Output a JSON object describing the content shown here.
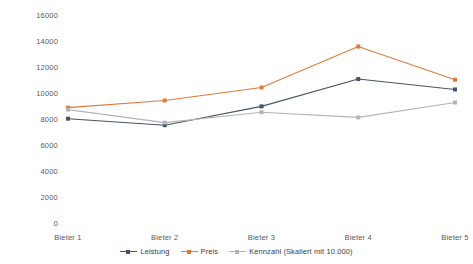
{
  "chart_data": {
    "type": "line",
    "title": "",
    "subtitle": "",
    "xlabel": "",
    "ylabel": "",
    "categories": [
      "Bieter 1",
      "Bieter 2",
      "Bieter 3",
      "Bieter 4",
      "Bieter 5"
    ],
    "series": [
      {
        "name": "Leistung",
        "color": "#44546A",
        "values": [
          8100,
          7600,
          9050,
          11150,
          10350
        ]
      },
      {
        "name": "Preis",
        "color": "#E07B39",
        "values": [
          8950,
          9500,
          10500,
          13650,
          11100
        ]
      },
      {
        "name": "Kennzahl (Skaliert mit 10.000)",
        "color": "#B4B4B4",
        "values": [
          8800,
          7800,
          8600,
          8200,
          9350
        ]
      }
    ],
    "ylim": [
      0,
      16000
    ],
    "ytick_step": 2000,
    "yticks": [
      "16000",
      "14000",
      "12000",
      "10000",
      "8000",
      "6000",
      "4000",
      "2000",
      "0"
    ],
    "grid": false,
    "legend_position": "bottom",
    "legend": [
      "Leistung",
      "Preis",
      "Kennzahl (Skaliert mit 10.000)"
    ]
  },
  "colors": {
    "leistung": "#44546A",
    "preis": "#E07B39",
    "kennzahl": "#B4B4B4",
    "axis_text": "#595959",
    "legend_text": "#404040",
    "background": "#ffffff"
  }
}
